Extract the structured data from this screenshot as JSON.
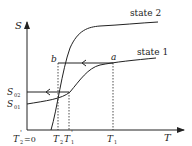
{
  "diagram": {
    "type": "entropy-temperature schematic",
    "axes": {
      "y_label": "S",
      "x_label": "T"
    },
    "curves": [
      {
        "name": "state 2",
        "label": "state 2"
      },
      {
        "name": "state 1",
        "label": "state 1"
      }
    ],
    "points": {
      "a": "a",
      "b": "b"
    },
    "y_ticks": {
      "s02": {
        "base": "S",
        "sub": "02"
      },
      "s01": {
        "base": "S",
        "sub": "01"
      }
    },
    "x_ticks": {
      "t2prime": {
        "base": "T",
        "sub": "2",
        "prime": "'",
        "suffix": "=0"
      },
      "t2": {
        "base": "T",
        "sub": "2"
      },
      "t1prime": {
        "base": "T",
        "sub": "1",
        "prime": "'"
      },
      "t1": {
        "base": "T",
        "sub": "1"
      }
    },
    "colors": {
      "ink": "#222222",
      "background": "#ffffff"
    }
  }
}
